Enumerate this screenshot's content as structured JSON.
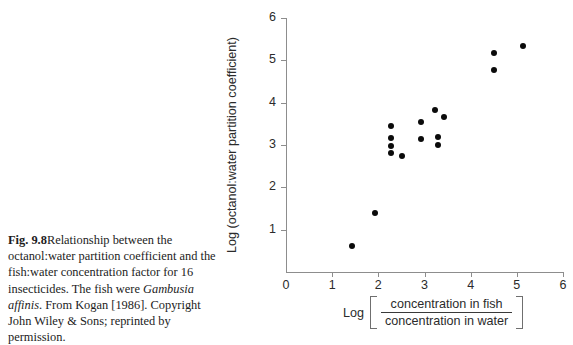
{
  "caption": {
    "figure_number": "Fig. 9.8",
    "text_part1": "Relationship between the octanol:water partition coefficient and the fish:water concentration factor for 16 insecticides. The fish were ",
    "species": "Gambusia affinis",
    "text_part2": ". From Kogan [1986]. Copyright John Wiley & Sons; reprinted by permission."
  },
  "chart_data": {
    "type": "scatter",
    "title": "",
    "xlabel": "Log [ concentration in fish / concentration in water ]",
    "ylabel": "Log (octanol:water partition coefficient)",
    "xlabel_parts": {
      "log": "Log",
      "numerator": "concentration in fish",
      "denominator": "concentration in water"
    },
    "xlim": [
      0,
      6
    ],
    "ylim": [
      0,
      6
    ],
    "xticks": [
      0,
      1,
      2,
      3,
      4,
      5,
      6
    ],
    "yticks": [
      0,
      1,
      2,
      3,
      4,
      5,
      6
    ],
    "xtick_labels": [
      "0",
      "1",
      "2",
      "3",
      "4",
      "5",
      "6"
    ],
    "ytick_labels": [
      "0",
      "1",
      "2",
      "3",
      "4",
      "5",
      "6"
    ],
    "grid": false,
    "legend": false,
    "n_points": 16,
    "marker_color": "#0b0b0b",
    "axis_color": "#8d8d8d",
    "points": [
      {
        "x": 1.43,
        "y": 0.61
      },
      {
        "x": 1.93,
        "y": 1.39
      },
      {
        "x": 2.27,
        "y": 3.44
      },
      {
        "x": 2.27,
        "y": 3.16
      },
      {
        "x": 2.27,
        "y": 2.97
      },
      {
        "x": 2.27,
        "y": 2.8
      },
      {
        "x": 2.51,
        "y": 2.73
      },
      {
        "x": 2.92,
        "y": 3.54
      },
      {
        "x": 2.92,
        "y": 3.13
      },
      {
        "x": 3.22,
        "y": 3.82
      },
      {
        "x": 3.43,
        "y": 3.66
      },
      {
        "x": 3.3,
        "y": 3.18
      },
      {
        "x": 3.3,
        "y": 3.01
      },
      {
        "x": 4.5,
        "y": 4.76
      },
      {
        "x": 4.5,
        "y": 5.17
      },
      {
        "x": 5.14,
        "y": 5.35
      }
    ]
  }
}
